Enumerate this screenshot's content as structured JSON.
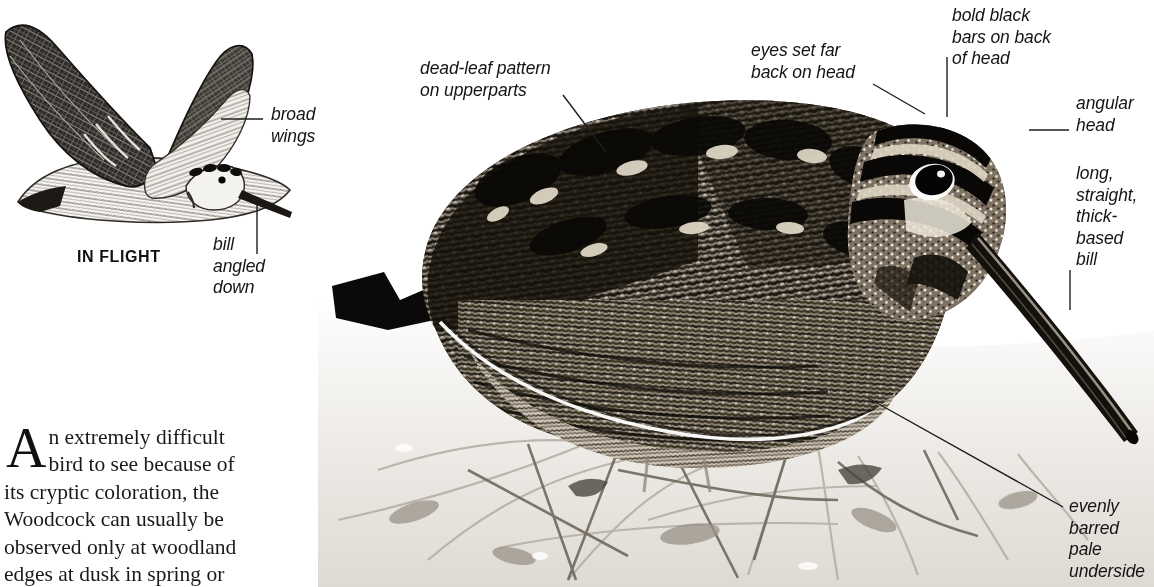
{
  "plate": {
    "species_common_name": "Woodcock",
    "background_color": "#ffffff",
    "ink_color": "#141414"
  },
  "inflight": {
    "caption": "IN FLIGHT",
    "callouts": [
      {
        "id": "broad-wings",
        "text": "broad\nwings"
      },
      {
        "id": "bill-angled-down",
        "text": "bill\nangled\ndown"
      }
    ]
  },
  "main_photo": {
    "subject": "perched-woodcock-photograph",
    "callouts": [
      {
        "id": "dead-leaf-pattern",
        "text": "dead-leaf pattern\non upperparts"
      },
      {
        "id": "eyes-set-far-back",
        "text": "eyes set far\nback on head"
      },
      {
        "id": "bold-black-bars",
        "text": "bold black\nbars on back\nof head"
      },
      {
        "id": "angular-head",
        "text": "angular\nhead"
      },
      {
        "id": "long-straight-bill",
        "text": "long,\nstraight,\nthick-\nbased\nbill"
      },
      {
        "id": "evenly-barred-underside",
        "text": "evenly\nbarred pale\nunderside"
      }
    ]
  },
  "body_text": {
    "dropcap": "A",
    "first_line_rest": "n extremely difficult",
    "lines": [
      "bird to see because of",
      "its cryptic coloration, the",
      "Woodcock can usually be",
      "observed only at woodland",
      "edges at dusk in spring or"
    ],
    "full_text": "An extremely difficult bird to see because of its cryptic coloration, the Woodcock can usually be observed only at woodland edges at dusk in spring or"
  }
}
